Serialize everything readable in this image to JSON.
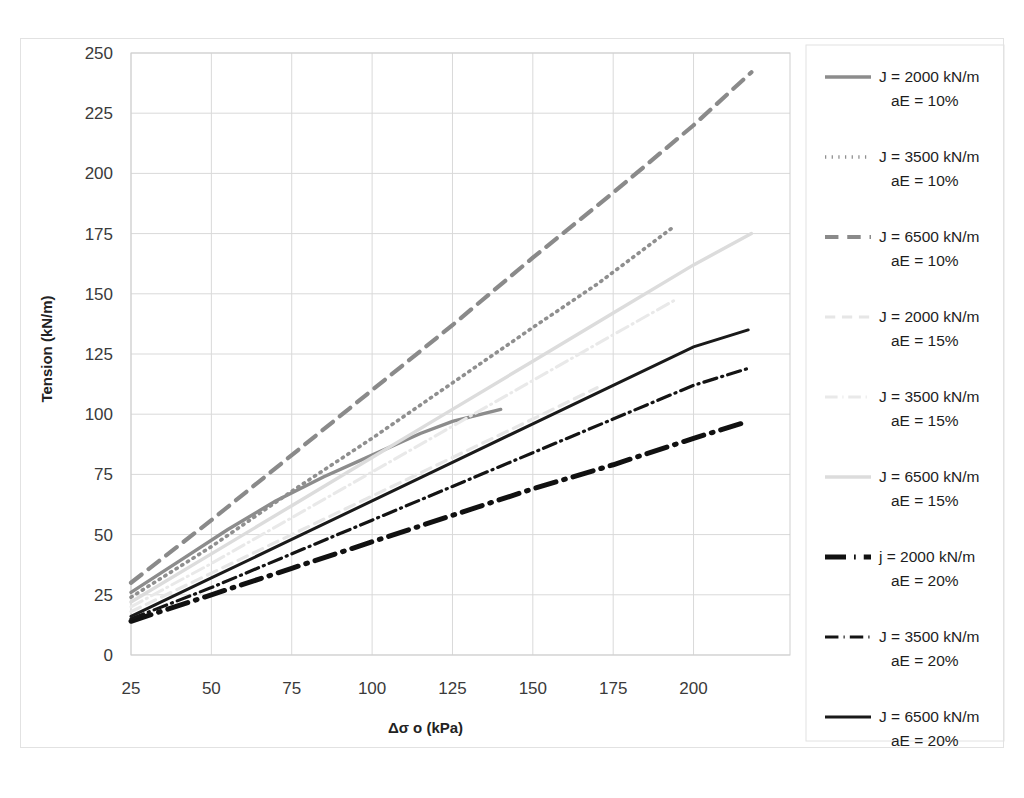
{
  "chart_data": {
    "type": "line",
    "title": "",
    "xlabel": "Δσ o (kPa)",
    "ylabel": "Tension (kN/m)",
    "xlim": [
      25,
      230
    ],
    "ylim": [
      0,
      250
    ],
    "xticks": [
      25,
      50,
      75,
      100,
      125,
      150,
      175,
      200
    ],
    "yticks": [
      0,
      25,
      50,
      75,
      100,
      125,
      150,
      175,
      200,
      225,
      250
    ],
    "grid": true,
    "legend_position": "right",
    "series": [
      {
        "name": "J = 2000 kN/m  aE = 10%",
        "label_line1": "J = 2000 kN/m",
        "label_line2": "aE = 10%",
        "color": "#8c8c8c",
        "width": 3.4,
        "dash": "none",
        "x": [
          25,
          40,
          55,
          70,
          85,
          100,
          115,
          125,
          140
        ],
        "y": [
          26,
          39,
          52,
          64,
          74,
          83,
          92,
          97,
          102
        ]
      },
      {
        "name": "J = 3500 kN/m  aE = 10%",
        "label_line1": "J = 3500 kN/m",
        "label_line2": "aE = 10%",
        "color": "#8f8f8f",
        "width": 3.6,
        "dash": "dotted",
        "x": [
          25,
          50,
          75,
          100,
          125,
          150,
          170,
          193
        ],
        "y": [
          24,
          45,
          68,
          90,
          113,
          136,
          154,
          177
        ]
      },
      {
        "name": "J = 6500 kN/m  aE = 10%",
        "label_line1": "J = 6500 kN/m",
        "label_line2": "aE = 10%",
        "color": "#8a8a8a",
        "width": 4.2,
        "dash": "dashed",
        "x": [
          25,
          50,
          75,
          100,
          125,
          150,
          175,
          200,
          218
        ],
        "y": [
          30,
          56,
          83,
          110,
          137,
          165,
          192,
          220,
          242
        ]
      },
      {
        "name": "J = 2000 kN/m  aE = 15%",
        "label_line1": "J = 2000 kN/m",
        "label_line2": "aE = 15%",
        "color": "#e6e6e6",
        "width": 3.2,
        "dash": "dashed",
        "x": [
          25,
          50,
          75,
          100,
          125,
          150,
          170
        ],
        "y": [
          18,
          34,
          50,
          66,
          82,
          98,
          111
        ]
      },
      {
        "name": "J = 3500 kN/m  aE = 15%",
        "label_line1": "J = 3500 kN/m",
        "label_line2": "aE = 15%",
        "color": "#e9e9e9",
        "width": 3.0,
        "dash": "dashdot",
        "x": [
          25,
          50,
          75,
          100,
          125,
          150,
          175,
          195
        ],
        "y": [
          20,
          38,
          57,
          76,
          95,
          114,
          133,
          148
        ]
      },
      {
        "name": "J = 6500 kN/m  aE = 15%",
        "label_line1": "J = 6500 kN/m",
        "label_line2": "aE = 15%",
        "color": "#dcdcdc",
        "width": 3.4,
        "dash": "none",
        "x": [
          25,
          50,
          75,
          100,
          125,
          150,
          175,
          200,
          218
        ],
        "y": [
          22,
          42,
          62,
          82,
          102,
          122,
          142,
          162,
          175
        ]
      },
      {
        "name": "j = 2000 kN/m  aE = 20%",
        "label_line1": "j = 2000 kN/m",
        "label_line2": "aE = 20%",
        "color": "#111111",
        "width": 5.0,
        "dash": "dashdot",
        "x": [
          25,
          50,
          75,
          100,
          125,
          150,
          175,
          200,
          217
        ],
        "y": [
          14,
          25,
          36,
          47,
          58,
          69,
          79,
          90,
          97
        ]
      },
      {
        "name": "J = 3500 kN/m  aE = 20%",
        "label_line1": "J = 3500 kN/m",
        "label_line2": "aE = 20%",
        "color": "#141414",
        "width": 3.2,
        "dash": "dashdot",
        "x": [
          25,
          50,
          75,
          100,
          125,
          150,
          175,
          200,
          217
        ],
        "y": [
          15,
          28,
          42,
          56,
          70,
          84,
          98,
          112,
          119
        ]
      },
      {
        "name": "J = 6500 kN/m  aE = 20%",
        "label_line1": "J = 6500 kN/m",
        "label_line2": "aE = 20%",
        "color": "#1a1a1a",
        "width": 3.0,
        "dash": "none",
        "x": [
          25,
          50,
          75,
          100,
          125,
          150,
          175,
          200,
          217
        ],
        "y": [
          16,
          32,
          48,
          64,
          80,
          96,
          112,
          128,
          135
        ]
      }
    ]
  },
  "legend": {
    "entries": [
      {
        "line1": "J = 2000 kN/m",
        "line2": "aE = 10%"
      },
      {
        "line1": "J = 3500 kN/m",
        "line2": "aE = 10%"
      },
      {
        "line1": "J = 6500 kN/m",
        "line2": "aE = 10%"
      },
      {
        "line1": "J = 2000 kN/m",
        "line2": "aE = 15%"
      },
      {
        "line1": "J = 3500 kN/m",
        "line2": "aE = 15%"
      },
      {
        "line1": "J = 6500 kN/m",
        "line2": "aE = 15%"
      },
      {
        "line1": "j = 2000 kN/m",
        "line2": "aE = 20%"
      },
      {
        "line1": "J = 3500 kN/m",
        "line2": "aE = 20%"
      },
      {
        "line1": "J = 6500 kN/m",
        "line2": "aE = 20%"
      }
    ]
  },
  "axes": {
    "y_title": "Tension (kN/m)",
    "x_title": "Δσ o (kPa)",
    "x_tick_labels": [
      "25",
      "50",
      "75",
      "100",
      "125",
      "150",
      "175",
      "200"
    ],
    "y_tick_labels": [
      "0",
      "25",
      "50",
      "75",
      "100",
      "125",
      "150",
      "175",
      "200",
      "225",
      "250"
    ]
  },
  "colors": {
    "grid": "#d9d9d9",
    "frame": "#e2e2e2",
    "text": "#2b2b2b"
  }
}
